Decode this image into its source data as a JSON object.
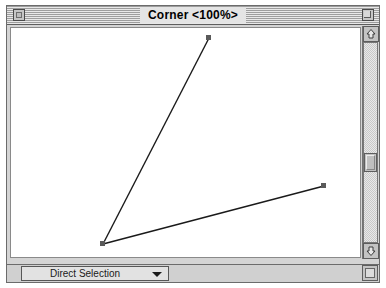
{
  "window": {
    "title": "Corner <100%>",
    "close_box": "close-box",
    "zoom_box": "zoom-box"
  },
  "toolbar": {
    "tool_label": "Direct Selection",
    "dropdown_icon": "chevron-down-icon"
  },
  "scrollbars": {
    "vertical": {
      "up_icon": "arrow-up-icon",
      "down_icon": "arrow-down-icon",
      "thumb_position_percent": 55
    },
    "horizontal": {
      "left_icon": "arrow-left-icon",
      "right_icon": "arrow-right-icon",
      "thumb_position_percent": 63
    },
    "grow_box": "resize-grip-icon"
  },
  "drawing": {
    "description": "Two selected line segments meeting at a corner anchor point",
    "stroke_color": "#1a1a1a",
    "anchor_color": "#4d4d4d",
    "paths": [
      {
        "name": "upper-segment",
        "from": [
          96,
          238
        ],
        "to": [
          202,
          32
        ]
      },
      {
        "name": "lower-segment",
        "from": [
          96,
          238
        ],
        "to": [
          317,
          180
        ]
      }
    ],
    "anchors": [
      {
        "name": "corner-anchor",
        "x": 96,
        "y": 238
      },
      {
        "name": "top-anchor",
        "x": 202,
        "y": 32
      },
      {
        "name": "right-anchor",
        "x": 317,
        "y": 180
      }
    ]
  }
}
